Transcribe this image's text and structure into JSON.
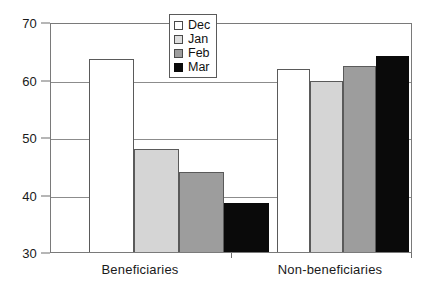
{
  "chart_data": {
    "type": "bar",
    "title": "",
    "subtitle": "",
    "xlabel": "",
    "ylabel": "",
    "categories": [
      "Beneficiaries",
      "Non-beneficiaries"
    ],
    "series": [
      {
        "name": "Dec",
        "color": "#ffffff",
        "values": [
          63.5,
          61.8
        ]
      },
      {
        "name": "Jan",
        "color": "#d5d5d5",
        "values": [
          48.0,
          59.8
        ]
      },
      {
        "name": "Feb",
        "color": "#9d9d9d",
        "values": [
          44.0,
          62.3
        ]
      },
      {
        "name": "Mar",
        "color": "#0a0a0a",
        "values": [
          38.5,
          64.1
        ]
      }
    ],
    "ylim": [
      30,
      70
    ],
    "yticks": [
      30,
      40,
      50,
      60,
      70
    ],
    "ytick_labels": [
      "30",
      "40",
      "50",
      "60",
      "70"
    ],
    "grid": true,
    "grid_axis": "y",
    "legend_position": "top-center-right",
    "legend_entries": [
      "Dec",
      "Jan",
      "Feb",
      "Mar"
    ],
    "annotations": []
  },
  "axes": {
    "y_ticks": [
      {
        "label": "70",
        "value": 70
      },
      {
        "label": "60",
        "value": 60
      },
      {
        "label": "50",
        "value": 50
      },
      {
        "label": "40",
        "value": 40
      },
      {
        "label": "30",
        "value": 30
      }
    ],
    "x_groups": [
      {
        "label": "Beneficiaries"
      },
      {
        "label": "Non-beneficiaries"
      }
    ]
  },
  "legend": {
    "items": [
      {
        "label": "Dec",
        "swatch": "legend-swatch-dec"
      },
      {
        "label": "Jan",
        "swatch": "legend-swatch-jan"
      },
      {
        "label": "Feb",
        "swatch": "legend-swatch-feb"
      },
      {
        "label": "Mar",
        "swatch": "legend-swatch-mar"
      }
    ]
  }
}
